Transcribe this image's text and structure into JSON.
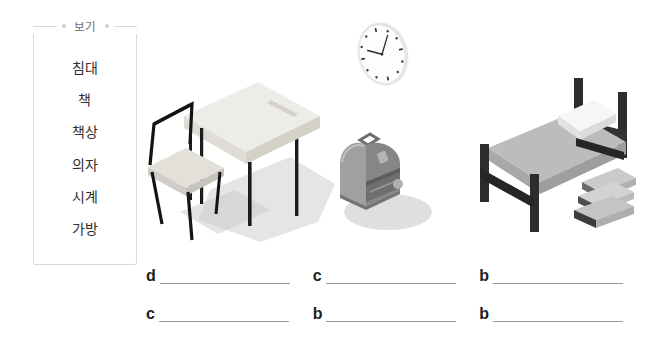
{
  "page": {
    "background_color": "#ffffff",
    "type": "korean-vocabulary-worksheet"
  },
  "word_bank": {
    "title": "보기",
    "left_dot": "dot-decoration",
    "right_dot": "dot-decoration",
    "border_color": "#d9d9d9",
    "words": [
      {
        "text": "침대"
      },
      {
        "text": "책"
      },
      {
        "text": "책상"
      },
      {
        "text": "의자"
      },
      {
        "text": "시계"
      },
      {
        "text": "가방"
      }
    ]
  },
  "illustrations": [
    {
      "name": "desk-and-chair",
      "icon": "desk-icon",
      "colors": {
        "top": "#ecebe5",
        "side": "#dcdbd4",
        "leg": "#1c1c1c",
        "shadow": "#bfbfbf"
      }
    },
    {
      "name": "wall-clock",
      "icon": "clock-icon",
      "time_shown": "10:10",
      "colors": {
        "face": "#ffffff",
        "rim": "#e4e4e6",
        "tick": "#3a3a3a",
        "hand": "#2b2b2b"
      }
    },
    {
      "name": "backpack",
      "icon": "backpack-icon",
      "colors": {
        "body": "#9a9a9a",
        "front": "#7e7e7e",
        "dark": "#6a6a6a",
        "shadow": "#c6c6c6"
      }
    },
    {
      "name": "bed-with-books",
      "icon": "bed-icon",
      "colors": {
        "frame": "#2a2a2a",
        "mattress": "#b6b6b6",
        "pillow": "#f4f4f4",
        "book_light": "#c9c9c9",
        "book_dark": "#555555"
      }
    }
  ],
  "answers": {
    "row1": [
      {
        "letter": "d",
        "value": ""
      },
      {
        "letter": "c",
        "value": ""
      },
      {
        "letter": "b",
        "value": ""
      }
    ],
    "row2": [
      {
        "letter": "c",
        "value": ""
      },
      {
        "letter": "b",
        "value": ""
      },
      {
        "letter": "b",
        "value": ""
      }
    ],
    "line_color": "#9b9b9b"
  }
}
